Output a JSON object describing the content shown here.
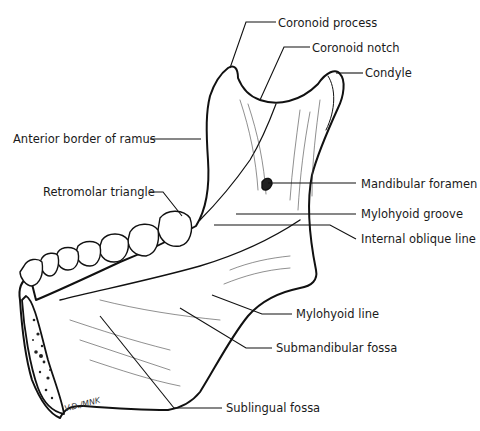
{
  "figure": {
    "signature": "V.D./MNK"
  },
  "labels": [
    {
      "id": "coronoid-process",
      "text": "Coronoid process"
    },
    {
      "id": "coronoid-notch",
      "text": "Coronoid notch"
    },
    {
      "id": "condyle",
      "text": "Condyle"
    },
    {
      "id": "anterior-border-of-ramus",
      "text": "Anterior border of ramus"
    },
    {
      "id": "retromolar-triangle",
      "text": "Retromolar triangle"
    },
    {
      "id": "mandibular-foramen",
      "text": "Mandibular foramen"
    },
    {
      "id": "mylohyoid-groove",
      "text": "Mylohyoid groove"
    },
    {
      "id": "internal-oblique-line",
      "text": "Internal oblique line"
    },
    {
      "id": "mylohyoid-line",
      "text": "Mylohyoid line"
    },
    {
      "id": "submandibular-fossa",
      "text": "Submandibular fossa"
    },
    {
      "id": "sublingual-fossa",
      "text": "Sublingual fossa"
    }
  ]
}
